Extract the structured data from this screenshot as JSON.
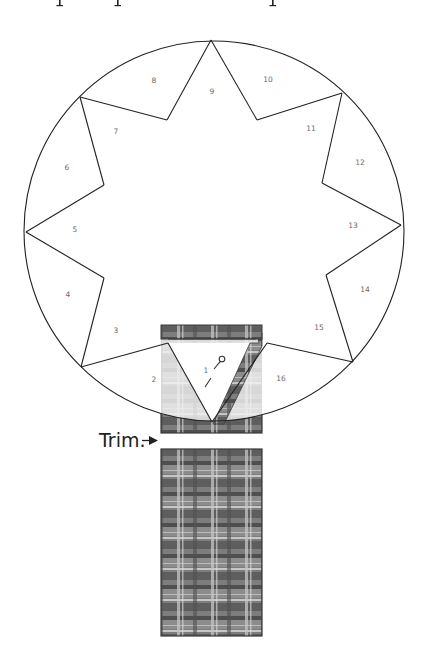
{
  "diagram": {
    "title_fragment": "p p p",
    "colors": {
      "line": "#222222",
      "label": "#6a6a6a",
      "plaid_base": "#7d7d7d",
      "plaid_dark": "#5a5a5a",
      "plaid_light": "#c9c9c9",
      "plaid_frame": "#3a3a3a",
      "translucent_fabric": "#f3f3f3"
    },
    "circle": {
      "cx": 214,
      "cy": 231,
      "r": 190
    },
    "segments": [
      {
        "id": 1,
        "label": "1",
        "x": 206,
        "y": 371
      },
      {
        "id": 2,
        "label": "2",
        "x": 154,
        "y": 380
      },
      {
        "id": 3,
        "label": "3",
        "x": 116,
        "y": 331
      },
      {
        "id": 4,
        "label": "4",
        "x": 68,
        "y": 295
      },
      {
        "id": 5,
        "label": "5",
        "x": 75,
        "y": 230
      },
      {
        "id": 6,
        "label": "6",
        "x": 67,
        "y": 168
      },
      {
        "id": 7,
        "label": "7",
        "x": 116,
        "y": 132
      },
      {
        "id": 8,
        "label": "8",
        "x": 154,
        "y": 81
      },
      {
        "id": 9,
        "label": "9",
        "x": 212,
        "y": 92
      },
      {
        "id": 10,
        "label": "10",
        "x": 268,
        "y": 80
      },
      {
        "id": 11,
        "label": "11",
        "x": 311,
        "y": 129
      },
      {
        "id": 12,
        "label": "12",
        "x": 360,
        "y": 163
      },
      {
        "id": 13,
        "label": "13",
        "x": 353,
        "y": 226
      },
      {
        "id": 14,
        "label": "14",
        "x": 365,
        "y": 290
      },
      {
        "id": 15,
        "label": "15",
        "x": 319,
        "y": 328
      },
      {
        "id": 16,
        "label": "16",
        "x": 281,
        "y": 379
      }
    ],
    "outer_points": [
      [
        211,
        40
      ],
      [
        342,
        93
      ],
      [
        401,
        225
      ],
      [
        353,
        362
      ],
      [
        212,
        422
      ],
      [
        81,
        367
      ],
      [
        26,
        232
      ],
      [
        80,
        97
      ]
    ],
    "inner_points": [
      [
        257,
        120
      ],
      [
        322,
        183
      ],
      [
        326,
        275
      ],
      [
        267,
        343
      ],
      [
        168,
        343
      ],
      [
        104,
        278
      ],
      [
        104,
        185
      ],
      [
        167,
        120
      ]
    ],
    "upper_fabric": {
      "x": 161,
      "y": 325,
      "w": 101,
      "h": 108
    },
    "lower_fabric": {
      "x": 161,
      "y": 449,
      "w": 101,
      "h": 187
    },
    "trim_label": "Trim.",
    "pin_symbol": "pin-icon"
  }
}
